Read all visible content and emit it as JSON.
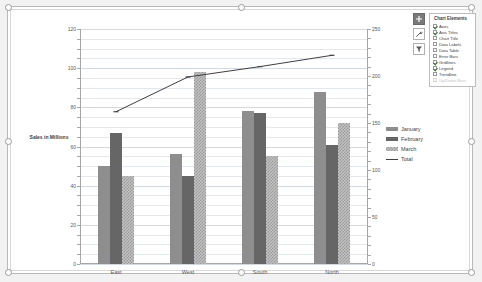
{
  "chart_data": {
    "type": "bar",
    "title": "",
    "xlabel": "",
    "ylabel": "Sales in Millions",
    "categories": [
      "East",
      "West",
      "South",
      "North"
    ],
    "series": [
      {
        "name": "January",
        "type": "bar",
        "axis": "left",
        "values": [
          50,
          56,
          78,
          88
        ]
      },
      {
        "name": "February",
        "type": "bar",
        "axis": "left",
        "values": [
          67,
          45,
          77,
          61
        ]
      },
      {
        "name": "March",
        "type": "bar",
        "axis": "left",
        "values": [
          45,
          98,
          55,
          72
        ]
      },
      {
        "name": "Total",
        "type": "line",
        "axis": "right",
        "values": [
          162,
          199,
          210,
          222
        ]
      }
    ],
    "ylim": [
      0,
      120
    ],
    "yticks": [
      0,
      20,
      40,
      60,
      80,
      100,
      120
    ],
    "y2lim": [
      0,
      250
    ],
    "y2ticks": [
      0,
      50,
      100,
      150,
      200,
      250
    ],
    "grid": true,
    "legend_position": "right",
    "colors": {
      "january": "#8e8e8e",
      "february": "#666666",
      "march": "#c0c0c0",
      "total": "#404040",
      "gridline": "#e4e8ee",
      "axis": "#a6a6a6"
    }
  },
  "legend": {
    "entries": [
      {
        "label": "January",
        "key": "jan"
      },
      {
        "label": "February",
        "key": "feb"
      },
      {
        "label": "March",
        "key": "mar"
      },
      {
        "label": "Total",
        "key": "total"
      }
    ]
  },
  "float_buttons": [
    {
      "name": "chart-elements-button",
      "icon": "plus-icon",
      "active": true
    },
    {
      "name": "chart-styles-button",
      "icon": "paintbrush-icon",
      "active": false
    },
    {
      "name": "chart-filters-button",
      "icon": "funnel-icon",
      "active": false
    }
  ],
  "chart_elements_panel": {
    "title": "Chart Elements",
    "items": [
      {
        "label": "Axes",
        "checked": true,
        "disabled": false
      },
      {
        "label": "Axis Titles",
        "checked": true,
        "disabled": false
      },
      {
        "label": "Chart Title",
        "checked": false,
        "disabled": false
      },
      {
        "label": "Data Labels",
        "checked": false,
        "disabled": false
      },
      {
        "label": "Data Table",
        "checked": false,
        "disabled": false
      },
      {
        "label": "Error Bars",
        "checked": false,
        "disabled": false
      },
      {
        "label": "Gridlines",
        "checked": true,
        "disabled": false
      },
      {
        "label": "Legend",
        "checked": true,
        "disabled": false
      },
      {
        "label": "Trendline",
        "checked": false,
        "disabled": false
      },
      {
        "label": "Up/Down Bars",
        "checked": false,
        "disabled": true
      }
    ]
  }
}
